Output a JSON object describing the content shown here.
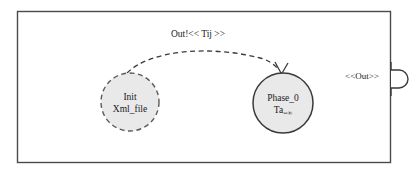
{
  "diagram": {
    "type": "devs-statechart",
    "title_visible": false,
    "container": {
      "name": "outer-boundary",
      "shape": "rectangle",
      "x": 17,
      "y": 11,
      "width": 374,
      "height": 152,
      "fill": "#ffffff",
      "stroke": "#4a4a4a"
    },
    "states": [
      {
        "id": "init",
        "name": "init-state",
        "shape": "circle",
        "cx": 130,
        "cy": 102,
        "r": 29,
        "border_style": "dashed",
        "fill": "#e9e9e9",
        "stroke": "#5a5a5a",
        "lines": [
          "Init",
          "Xml_file"
        ]
      },
      {
        "id": "phase_0",
        "name": "phase-0-state",
        "shape": "circle",
        "cx": 283,
        "cy": 103,
        "r": 30,
        "border_style": "solid",
        "fill": "#e9e9e9",
        "stroke": "#3a3a3a",
        "line1": "Phase_0",
        "line2_prefix": "Ta",
        "line2_suffix": "=∞"
      }
    ],
    "transitions": [
      {
        "id": "t1",
        "name": "init-to-phase0-transition",
        "from": "init",
        "to": "phase_0",
        "style": "dashed",
        "label": "Out!<< Tij >>",
        "label_x": 198,
        "label_y": 37,
        "stroke": "#3a3a3a",
        "arrowhead": "open-v"
      }
    ],
    "ports": [
      {
        "id": "out",
        "name": "out-port",
        "label": "<<Out>>",
        "label_x": 362,
        "label_y": 78,
        "shape": "semicircle-bump",
        "cx": 391,
        "cy": 79,
        "r": 9,
        "stroke": "#3a3a3a",
        "fill": "#ffffff"
      }
    ]
  },
  "colors": {
    "background": "#ffffff",
    "boundary_stroke": "#4a4a4a",
    "state_fill": "#e9e9e9",
    "state_stroke_solid": "#3a3a3a",
    "state_stroke_dashed": "#5a5a5a",
    "text": "#1a1a1a"
  }
}
